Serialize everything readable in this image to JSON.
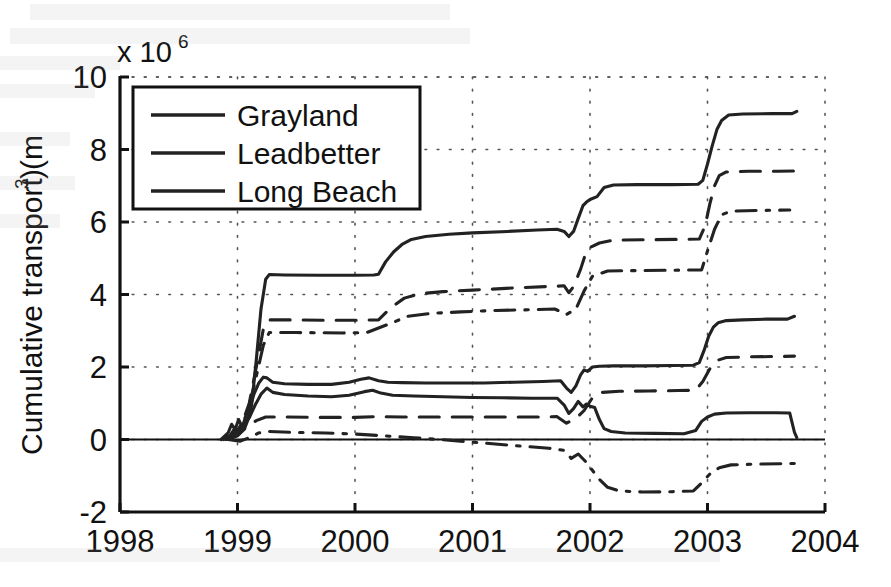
{
  "chart_data": {
    "type": "line",
    "title": "",
    "xlabel": "",
    "ylabel": "Cumulative transport (m",
    "ylabel_sup": "3",
    "ylabel_suffix": ")",
    "exponent_prefix": "x 10",
    "exponent_power": "6",
    "y_scale_factor": 1000000,
    "xlim": [
      1998,
      2004
    ],
    "ylim": [
      -2,
      10
    ],
    "xticks": [
      1998,
      1999,
      2000,
      2001,
      2002,
      2003,
      2004
    ],
    "xticklabels": [
      "1998",
      "1999",
      "2000",
      "2001",
      "2002",
      "2003",
      "2004"
    ],
    "yticks": [
      -2,
      0,
      2,
      4,
      6,
      8,
      10
    ],
    "yticklabels": [
      "-2",
      "0",
      "2",
      "4",
      "6",
      "8",
      "10"
    ],
    "grid": true,
    "grid_style": "dotted",
    "legend_position": "upper left",
    "legend_entries": [
      "Grayland",
      "Leadbetter",
      "Long Beach"
    ],
    "line_color": "#222222",
    "zero_line": true,
    "series": [
      {
        "name": "Grayland",
        "linestyle": "solid",
        "group": "upper",
        "points": [
          [
            1998.88,
            0.02
          ],
          [
            1998.94,
            0.1
          ],
          [
            1998.97,
            0.25
          ],
          [
            1999.0,
            0.18
          ],
          [
            1999.03,
            0.4
          ],
          [
            1999.06,
            0.3
          ],
          [
            1999.09,
            0.55
          ],
          [
            1999.12,
            0.95
          ],
          [
            1999.16,
            2.2
          ],
          [
            1999.2,
            3.6
          ],
          [
            1999.24,
            4.42
          ],
          [
            1999.27,
            4.55
          ],
          [
            1999.4,
            4.54
          ],
          [
            1999.7,
            4.53
          ],
          [
            2000.0,
            4.53
          ],
          [
            2000.16,
            4.54
          ],
          [
            2000.2,
            4.56
          ],
          [
            2000.26,
            4.9
          ],
          [
            2000.33,
            5.18
          ],
          [
            2000.4,
            5.38
          ],
          [
            2000.48,
            5.52
          ],
          [
            2000.6,
            5.6
          ],
          [
            2000.8,
            5.66
          ],
          [
            2001.0,
            5.7
          ],
          [
            2001.3,
            5.74
          ],
          [
            2001.55,
            5.78
          ],
          [
            2001.72,
            5.8
          ],
          [
            2001.78,
            5.74
          ],
          [
            2001.82,
            5.6
          ],
          [
            2001.86,
            5.74
          ],
          [
            2001.9,
            6.1
          ],
          [
            2001.94,
            6.45
          ],
          [
            2001.97,
            6.55
          ],
          [
            2002.0,
            6.62
          ],
          [
            2002.06,
            6.7
          ],
          [
            2002.12,
            6.95
          ],
          [
            2002.2,
            7.02
          ],
          [
            2002.4,
            7.03
          ],
          [
            2002.7,
            7.03
          ],
          [
            2002.92,
            7.04
          ],
          [
            2002.96,
            7.15
          ],
          [
            2003.0,
            7.6
          ],
          [
            2003.04,
            8.1
          ],
          [
            2003.08,
            8.55
          ],
          [
            2003.12,
            8.8
          ],
          [
            2003.18,
            8.95
          ],
          [
            2003.3,
            8.98
          ],
          [
            2003.55,
            8.99
          ],
          [
            2003.72,
            8.99
          ],
          [
            2003.76,
            9.05
          ]
        ]
      },
      {
        "name": "Leadbetter",
        "linestyle": "dashed",
        "group": "upper",
        "points": [
          [
            1998.9,
            0.02
          ],
          [
            1998.98,
            0.15
          ],
          [
            1999.04,
            0.45
          ],
          [
            1999.1,
            1.0
          ],
          [
            1999.16,
            2.0
          ],
          [
            1999.22,
            3.05
          ],
          [
            1999.27,
            3.3
          ],
          [
            1999.45,
            3.3
          ],
          [
            1999.75,
            3.29
          ],
          [
            2000.0,
            3.29
          ],
          [
            2000.2,
            3.3
          ],
          [
            2000.3,
            3.62
          ],
          [
            2000.42,
            3.9
          ],
          [
            2000.55,
            4.02
          ],
          [
            2000.75,
            4.08
          ],
          [
            2001.0,
            4.12
          ],
          [
            2001.35,
            4.18
          ],
          [
            2001.65,
            4.22
          ],
          [
            2001.78,
            4.24
          ],
          [
            2001.82,
            4.05
          ],
          [
            2001.86,
            4.22
          ],
          [
            2001.92,
            4.7
          ],
          [
            2001.96,
            5.1
          ],
          [
            2002.0,
            5.3
          ],
          [
            2002.08,
            5.42
          ],
          [
            2002.2,
            5.5
          ],
          [
            2002.45,
            5.51
          ],
          [
            2002.75,
            5.52
          ],
          [
            2002.93,
            5.53
          ],
          [
            2002.98,
            5.9
          ],
          [
            2003.02,
            6.5
          ],
          [
            2003.06,
            7.0
          ],
          [
            2003.1,
            7.28
          ],
          [
            2003.16,
            7.38
          ],
          [
            2003.35,
            7.4
          ],
          [
            2003.6,
            7.4
          ],
          [
            2003.76,
            7.41
          ]
        ]
      },
      {
        "name": "Long Beach",
        "linestyle": "dashdot",
        "group": "upper",
        "points": [
          [
            1998.9,
            0.0
          ],
          [
            1999.0,
            0.2
          ],
          [
            1999.08,
            0.7
          ],
          [
            1999.15,
            1.6
          ],
          [
            1999.22,
            2.6
          ],
          [
            1999.27,
            2.95
          ],
          [
            1999.5,
            2.95
          ],
          [
            1999.9,
            2.94
          ],
          [
            2000.1,
            2.95
          ],
          [
            2000.3,
            3.2
          ],
          [
            2000.45,
            3.4
          ],
          [
            2000.65,
            3.48
          ],
          [
            2000.9,
            3.52
          ],
          [
            2001.2,
            3.56
          ],
          [
            2001.5,
            3.58
          ],
          [
            2001.7,
            3.6
          ],
          [
            2001.8,
            3.45
          ],
          [
            2001.88,
            3.6
          ],
          [
            2001.95,
            4.1
          ],
          [
            2002.02,
            4.5
          ],
          [
            2002.15,
            4.65
          ],
          [
            2002.4,
            4.66
          ],
          [
            2002.7,
            4.67
          ],
          [
            2002.95,
            4.68
          ],
          [
            2003.0,
            5.2
          ],
          [
            2003.06,
            5.8
          ],
          [
            2003.12,
            6.2
          ],
          [
            2003.2,
            6.3
          ],
          [
            2003.45,
            6.32
          ],
          [
            2003.7,
            6.33
          ]
        ]
      },
      {
        "name": "Grayland",
        "linestyle": "solid",
        "group": "lower-a",
        "points": [
          [
            1998.86,
            0.0
          ],
          [
            1998.92,
            0.18
          ],
          [
            1998.95,
            0.42
          ],
          [
            1998.98,
            0.28
          ],
          [
            1999.01,
            0.55
          ],
          [
            1999.04,
            0.35
          ],
          [
            1999.07,
            0.62
          ],
          [
            1999.1,
            0.8
          ],
          [
            1999.14,
            1.25
          ],
          [
            1999.18,
            1.55
          ],
          [
            1999.22,
            1.72
          ],
          [
            1999.25,
            1.7
          ],
          [
            1999.3,
            1.58
          ],
          [
            1999.4,
            1.54
          ],
          [
            1999.6,
            1.52
          ],
          [
            1999.8,
            1.52
          ],
          [
            1999.95,
            1.58
          ],
          [
            2000.05,
            1.66
          ],
          [
            2000.12,
            1.7
          ],
          [
            2000.2,
            1.62
          ],
          [
            2000.28,
            1.58
          ],
          [
            2000.4,
            1.57
          ],
          [
            2000.6,
            1.56
          ],
          [
            2000.85,
            1.56
          ],
          [
            2001.1,
            1.56
          ],
          [
            2001.35,
            1.58
          ],
          [
            2001.6,
            1.6
          ],
          [
            2001.75,
            1.62
          ],
          [
            2001.8,
            1.42
          ],
          [
            2001.84,
            1.3
          ],
          [
            2001.88,
            1.48
          ],
          [
            2001.92,
            1.78
          ],
          [
            2001.95,
            1.92
          ],
          [
            2001.98,
            1.88
          ],
          [
            2002.02,
            2.0
          ],
          [
            2002.08,
            2.02
          ],
          [
            2002.2,
            2.03
          ],
          [
            2002.45,
            2.03
          ],
          [
            2002.7,
            2.04
          ],
          [
            2002.88,
            2.05
          ],
          [
            2002.93,
            2.12
          ],
          [
            2002.97,
            2.45
          ],
          [
            2003.01,
            2.85
          ],
          [
            2003.05,
            3.1
          ],
          [
            2003.09,
            3.22
          ],
          [
            2003.16,
            3.28
          ],
          [
            2003.3,
            3.3
          ],
          [
            2003.5,
            3.32
          ],
          [
            2003.68,
            3.32
          ],
          [
            2003.74,
            3.4
          ]
        ]
      },
      {
        "name": "Grayland",
        "linestyle": "solid",
        "group": "lower-b",
        "points": [
          [
            1998.88,
            0.0
          ],
          [
            1998.94,
            0.12
          ],
          [
            1998.98,
            0.32
          ],
          [
            1999.02,
            0.2
          ],
          [
            1999.06,
            0.45
          ],
          [
            1999.1,
            0.6
          ],
          [
            1999.15,
            0.95
          ],
          [
            1999.2,
            1.25
          ],
          [
            1999.25,
            1.42
          ],
          [
            1999.3,
            1.3
          ],
          [
            1999.4,
            1.24
          ],
          [
            1999.6,
            1.2
          ],
          [
            1999.8,
            1.18
          ],
          [
            1999.95,
            1.22
          ],
          [
            2000.08,
            1.32
          ],
          [
            2000.15,
            1.36
          ],
          [
            2000.22,
            1.28
          ],
          [
            2000.32,
            1.22
          ],
          [
            2000.5,
            1.2
          ],
          [
            2000.75,
            1.18
          ],
          [
            2001.0,
            1.16
          ],
          [
            2001.25,
            1.15
          ],
          [
            2001.5,
            1.14
          ],
          [
            2001.72,
            1.14
          ],
          [
            2001.78,
            0.95
          ],
          [
            2001.82,
            0.72
          ],
          [
            2001.86,
            0.85
          ],
          [
            2001.9,
            1.05
          ],
          [
            2001.94,
            0.9
          ],
          [
            2001.97,
            0.98
          ],
          [
            2002.0,
            0.92
          ],
          [
            2002.04,
            0.88
          ],
          [
            2002.08,
            0.55
          ],
          [
            2002.12,
            0.3
          ],
          [
            2002.18,
            0.22
          ],
          [
            2002.3,
            0.18
          ],
          [
            2002.55,
            0.17
          ],
          [
            2002.8,
            0.16
          ],
          [
            2002.9,
            0.25
          ],
          [
            2002.95,
            0.5
          ],
          [
            2003.0,
            0.62
          ],
          [
            2003.06,
            0.7
          ],
          [
            2003.16,
            0.73
          ],
          [
            2003.35,
            0.74
          ],
          [
            2003.58,
            0.74
          ],
          [
            2003.7,
            0.73
          ],
          [
            2003.74,
            0.2
          ],
          [
            2003.76,
            0.05
          ]
        ]
      },
      {
        "name": "Leadbetter",
        "linestyle": "dashed",
        "group": "lower-a",
        "points": [
          [
            1998.92,
            0.0
          ],
          [
            1999.0,
            0.1
          ],
          [
            1999.08,
            0.35
          ],
          [
            1999.16,
            0.52
          ],
          [
            1999.24,
            0.62
          ],
          [
            1999.4,
            0.62
          ],
          [
            1999.7,
            0.61
          ],
          [
            2000.0,
            0.61
          ],
          [
            2000.2,
            0.63
          ],
          [
            2000.4,
            0.62
          ],
          [
            2000.7,
            0.62
          ],
          [
            2001.0,
            0.62
          ],
          [
            2001.3,
            0.62
          ],
          [
            2001.55,
            0.62
          ],
          [
            2001.72,
            0.63
          ],
          [
            2001.8,
            0.45
          ],
          [
            2001.88,
            0.58
          ],
          [
            2001.95,
            0.8
          ],
          [
            2002.02,
            1.15
          ],
          [
            2002.1,
            1.3
          ],
          [
            2002.25,
            1.33
          ],
          [
            2002.5,
            1.34
          ],
          [
            2002.75,
            1.35
          ],
          [
            2002.9,
            1.36
          ],
          [
            2002.96,
            1.6
          ],
          [
            2003.02,
            1.95
          ],
          [
            2003.08,
            2.18
          ],
          [
            2003.16,
            2.26
          ],
          [
            2003.35,
            2.28
          ],
          [
            2003.6,
            2.29
          ],
          [
            2003.74,
            2.3
          ]
        ]
      },
      {
        "name": "Long Beach",
        "linestyle": "dashdot",
        "group": "lower-b",
        "points": [
          [
            1998.92,
            0.0
          ],
          [
            1999.02,
            -0.05
          ],
          [
            1999.1,
            0.05
          ],
          [
            1999.18,
            0.18
          ],
          [
            1999.26,
            0.22
          ],
          [
            1999.45,
            0.2
          ],
          [
            1999.75,
            0.18
          ],
          [
            2000.0,
            0.15
          ],
          [
            2000.25,
            0.1
          ],
          [
            2000.5,
            0.05
          ],
          [
            2000.8,
            -0.02
          ],
          [
            2001.1,
            -0.1
          ],
          [
            2001.4,
            -0.18
          ],
          [
            2001.65,
            -0.24
          ],
          [
            2001.78,
            -0.3
          ],
          [
            2001.84,
            -0.52
          ],
          [
            2001.9,
            -0.4
          ],
          [
            2001.96,
            -0.6
          ],
          [
            2002.02,
            -0.85
          ],
          [
            2002.08,
            -1.1
          ],
          [
            2002.15,
            -1.32
          ],
          [
            2002.25,
            -1.42
          ],
          [
            2002.45,
            -1.45
          ],
          [
            2002.7,
            -1.44
          ],
          [
            2002.88,
            -1.42
          ],
          [
            2002.95,
            -1.2
          ],
          [
            2003.02,
            -0.95
          ],
          [
            2003.1,
            -0.78
          ],
          [
            2003.2,
            -0.7
          ],
          [
            2003.4,
            -0.68
          ],
          [
            2003.62,
            -0.67
          ],
          [
            2003.74,
            -0.66
          ]
        ]
      }
    ]
  },
  "axes": {
    "exponent_prefix": "x 10",
    "exponent_power": "6",
    "y_title_main": "Cumulative transport (m",
    "y_title_sup": "3",
    "y_title_end": ")"
  },
  "legend": {
    "items": [
      {
        "label": "Grayland",
        "style": "solid"
      },
      {
        "label": "Leadbetter",
        "style": "solid"
      },
      {
        "label": "Long Beach",
        "style": "solid"
      }
    ]
  }
}
